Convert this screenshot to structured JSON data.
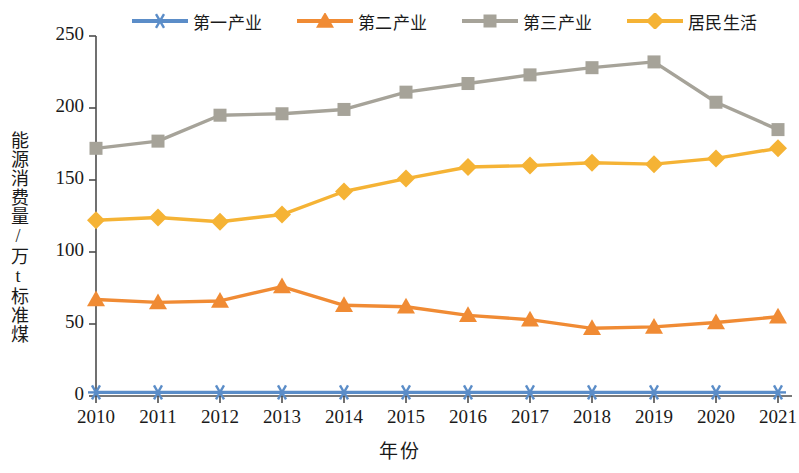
{
  "chart_data": {
    "type": "line",
    "title": "",
    "xlabel": "年份",
    "ylabel": "能源消费量/万t标准煤",
    "categories": [
      "2010",
      "2011",
      "2012",
      "2013",
      "2014",
      "2015",
      "2016",
      "2017",
      "2018",
      "2019",
      "2020",
      "2021"
    ],
    "ylim": [
      0,
      250
    ],
    "yticks": [
      0,
      50,
      100,
      150,
      200,
      250
    ],
    "grid": false,
    "legend_position": "top",
    "series": [
      {
        "name": "第一产业",
        "color": "#5B8DC8",
        "marker": "asterisk",
        "values": [
          2.5,
          2.5,
          2.5,
          2.5,
          2.5,
          2.5,
          2.5,
          2.5,
          2.5,
          2.5,
          2.5,
          2.5
        ]
      },
      {
        "name": "第二产业",
        "color": "#F08B34",
        "marker": "triangle",
        "values": [
          67,
          65,
          66,
          76,
          63,
          62,
          56,
          53,
          47,
          48,
          51,
          55
        ]
      },
      {
        "name": "第三产业",
        "color": "#A6A399",
        "marker": "square",
        "values": [
          172,
          177,
          195,
          196,
          199,
          211,
          217,
          223,
          228,
          232,
          204,
          185
        ]
      },
      {
        "name": "居民生活",
        "color": "#F5B335",
        "marker": "diamond",
        "values": [
          122,
          124,
          121,
          126,
          142,
          151,
          159,
          160,
          162,
          161,
          165,
          172
        ]
      }
    ]
  },
  "axis": {
    "y_tick_labels": [
      "250",
      "200",
      "150",
      "100",
      "50",
      "0"
    ],
    "x_tick_labels": [
      "2010",
      "2011",
      "2012",
      "2013",
      "2014",
      "2015",
      "2016",
      "2017",
      "2018",
      "2019",
      "2020",
      "2021"
    ]
  },
  "legend": {
    "items": [
      {
        "label": "第一产业",
        "color": "#5B8DC8",
        "marker": "asterisk"
      },
      {
        "label": "第二产业",
        "color": "#F08B34",
        "marker": "triangle"
      },
      {
        "label": "第三产业",
        "color": "#A6A399",
        "marker": "square"
      },
      {
        "label": "居民生活",
        "color": "#F5B335",
        "marker": "diamond"
      }
    ]
  },
  "labels": {
    "x_axis_title": "年份",
    "y_axis_title": "能源消费量/万t标准煤"
  }
}
